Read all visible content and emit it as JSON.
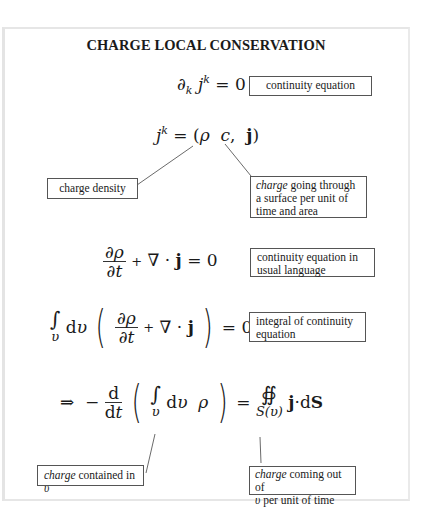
{
  "diagram": {
    "title": "CHARGE LOCAL CONSERVATION",
    "equations": [
      {
        "id": "eq1",
        "latex": "\\partial_k j^k = 0",
        "note": "continuity equation"
      },
      {
        "id": "eq2",
        "latex": "j^k = (\\rho c, \\mathbf{j})"
      },
      {
        "id": "eq3",
        "latex": "\\frac{\\partial\\rho}{\\partial t} + \\nabla\\cdot\\mathbf{j} = 0",
        "note": "continuity equation in usual language"
      },
      {
        "id": "eq4",
        "latex": "\\int_v dv \\left(\\frac{\\partial\\rho}{\\partial t} + \\nabla\\cdot\\mathbf{j}\\right) = 0",
        "note": "integral of continuity equation"
      },
      {
        "id": "eq5",
        "latex": "\\Rightarrow -\\frac{d}{dt}\\left(\\int_v dv \\rho\\right) = \\oiint_{S(v)} \\mathbf{j}\\cdot d\\mathbf{S}"
      }
    ],
    "notes": {
      "continuity": "continuity equation",
      "charge_density": "charge density",
      "current_italic": "charge",
      "current_rest": " going through a surface per unit of time and area",
      "usual": "continuity equation in usual language",
      "integral": "integral of continuity equation",
      "contained_italic": "charge",
      "contained_rest": " contained in ",
      "contained_var": "υ",
      "outflow_italic": "charge",
      "outflow_rest_1": " coming out of",
      "outflow_var": "υ",
      "outflow_rest_2": " per unit of time"
    },
    "symbols": {
      "partial": "∂",
      "sub_k": "k",
      "j": "j",
      "sup_k": "k",
      "eq0": " = 0",
      "eq": " = ",
      "rho": "ρ",
      "c": "c",
      "bold_j": "j",
      "t": "t",
      "nabla": "∇",
      "dot": "·",
      "plus": "+",
      "integral": "∫",
      "oiint": "∯",
      "d": "d",
      "v": "υ",
      "S": "S",
      "arrow": "⇒",
      "minus": "−",
      "lparen": "(",
      "rparen": ")",
      "comma": ",",
      "Sv": "S(υ)",
      "zero": "0"
    }
  }
}
